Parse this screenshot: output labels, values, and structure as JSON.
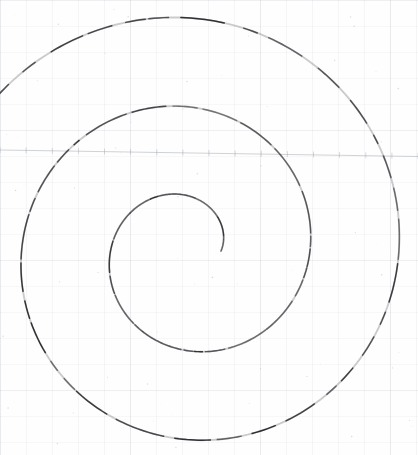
{
  "page": {
    "kind": "scanned-drawing",
    "width": 418,
    "height": 455,
    "background_color": "#fefefe",
    "ink_color": "#2b2b30",
    "grid_color": "#9aa0ab",
    "rule_color": "#9aa0ab",
    "title": "",
    "caption": "",
    "labels": []
  },
  "chart_data": {
    "type": "line",
    "title": "",
    "subtitle": "",
    "xlabel": "",
    "ylabel": "",
    "grid": true,
    "legend_position": "none",
    "legend": [],
    "annotations": [],
    "xlim": [
      0,
      418
    ],
    "ylim": [
      455,
      0
    ],
    "curve_kind": "archimedean-spiral",
    "spiral": {
      "center_x": 188,
      "center_y": 251,
      "theta_start_deg": 0,
      "theta_end_deg": 862,
      "r_start": 33,
      "r_end": 246,
      "direction": "counter-clockwise",
      "turns": 2.39,
      "stroke_width": 1.45,
      "dash_pattern": "broken"
    },
    "extremes": {
      "top_y": 22,
      "bottom_y": 436,
      "left_x": 33,
      "right_x": 398,
      "inner_endpoint": [
        221,
        250
      ],
      "outer_endpoint": [
        15,
        93
      ]
    },
    "series": [
      {
        "name": "spiral",
        "points_note": "r = 33 + 0.2486 * theta_deg, centred at (188, 251), theta measured counter-clockwise from the +x axis",
        "x": [
          221,
          217,
          205,
          188,
          169,
          151,
          137,
          129,
          127,
          132,
          145,
          163,
          186,
          212,
          238,
          260,
          277,
          288,
          290,
          285,
          271,
          249,
          221,
          188,
          153,
          119,
          89,
          65,
          48,
          40,
          41,
          52,
          72,
          100,
          134,
          172,
          211,
          249,
          284,
          313,
          336,
          350,
          356,
          352,
          339,
          318,
          288,
          252,
          212,
          171,
          130,
          93,
          61,
          38,
          22,
          15
        ],
        "y": [
          250,
          264,
          278,
          287,
          290,
          286,
          275,
          259,
          241,
          222,
          205,
          192,
          185,
          185,
          192,
          206,
          226,
          250,
          277,
          305,
          331,
          355,
          374,
          388,
          396,
          397,
          391,
          379,
          360,
          337,
          311,
          283,
          254,
          226,
          201,
          180,
          163,
          152,
          148,
          150,
          159,
          174,
          194,
          218,
          245,
          273,
          301,
          328,
          352,
          373,
          389,
          399,
          403,
          400,
          390,
          93
        ]
      }
    ],
    "ruled_line": {
      "present": true,
      "y_left": 150,
      "y_right": 156,
      "color": "#9aa0ab",
      "ticks": 16
    }
  }
}
